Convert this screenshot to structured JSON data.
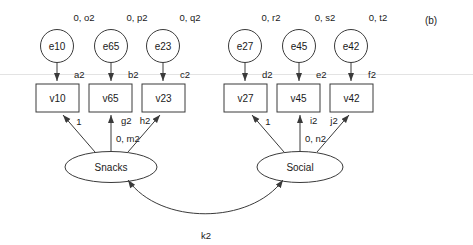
{
  "figure": {
    "panel_label": "(b)",
    "background_color": "#ffffff",
    "stroke_color": "#3a3a3a",
    "text_color": "#1a1a1a",
    "hairline_color": "#e3e3e3"
  },
  "latent_factors": [
    {
      "id": "snacks",
      "label": "Snacks",
      "variance_label": "0, m2"
    },
    {
      "id": "social",
      "label": "Social",
      "variance_label": "0, n2"
    }
  ],
  "indicators": [
    {
      "id": "v10",
      "label": "v10",
      "intercept_label": "a2",
      "loading_label": "1"
    },
    {
      "id": "v65",
      "label": "v65",
      "intercept_label": "b2",
      "loading_label": "g2"
    },
    {
      "id": "v23",
      "label": "v23",
      "intercept_label": "c2",
      "loading_label": "h2"
    },
    {
      "id": "v27",
      "label": "v27",
      "intercept_label": "d2",
      "loading_label": "1"
    },
    {
      "id": "v45",
      "label": "v45",
      "intercept_label": "e2",
      "loading_label": "i2"
    },
    {
      "id": "v42",
      "label": "v42",
      "intercept_label": "f2",
      "loading_label": "j2"
    }
  ],
  "errors": [
    {
      "id": "e10",
      "label": "e10",
      "variance_label": "0, o2"
    },
    {
      "id": "e65",
      "label": "e65",
      "variance_label": "0, p2"
    },
    {
      "id": "e23",
      "label": "e23",
      "variance_label": "0, q2"
    },
    {
      "id": "e27",
      "label": "e27",
      "variance_label": "0, r2"
    },
    {
      "id": "e45",
      "label": "e45",
      "variance_label": "0, s2"
    },
    {
      "id": "e42",
      "label": "e42",
      "variance_label": "0, t2"
    }
  ],
  "covariance": {
    "id": "k2",
    "label": "k2",
    "from": "Snacks",
    "to": "Social"
  }
}
